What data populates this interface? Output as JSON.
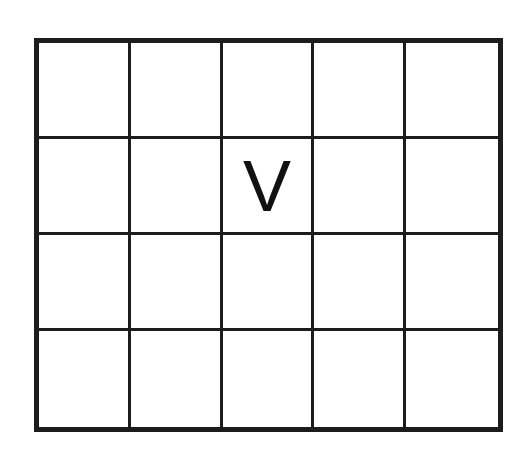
{
  "diagram": {
    "type": "grid",
    "rows": 4,
    "columns": 5,
    "cells": [
      [
        "",
        "",
        "",
        "",
        ""
      ],
      [
        "",
        "",
        "V",
        "",
        ""
      ],
      [
        "",
        "",
        "",
        "",
        ""
      ],
      [
        "",
        "",
        "",
        "",
        ""
      ]
    ],
    "line_color": "#1c1c1c",
    "background": "#ffffff"
  }
}
